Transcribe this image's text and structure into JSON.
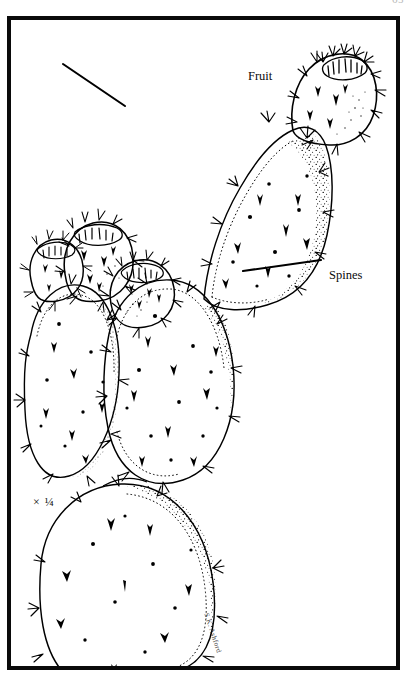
{
  "plate": {
    "page_number": "65",
    "scale_note": "× ¼",
    "artist_signature": "S.K. Ashford",
    "subject": "prickly-pear-cactus-opuntia-botanical-line-illustration"
  },
  "labels": {
    "fruit": "Fruit",
    "spines": "Spines"
  },
  "icons": {
    "fruit_leader": "leader-line-icon",
    "spines_leader": "leader-line-icon"
  },
  "illustration": {
    "style": "black-ink-line-drawing-with-stipple-shading",
    "ink_color": "#000000",
    "paper_color": "#ffffff",
    "frame_color": "#0a0a0a",
    "pads": [
      {
        "name": "upper-right-pad",
        "description": "large ovate cladode angled up to the right bearing fruit at its apex"
      },
      {
        "name": "upper-left-pad",
        "description": "ovate cladode on the left bearing two fruits at its apex"
      },
      {
        "name": "center-pad",
        "description": "large central cladode bearing one fruit at its upper left"
      },
      {
        "name": "basal-pad",
        "description": "lowest cladode, cropped by the lower frame edge"
      }
    ],
    "fruits": [
      {
        "name": "fruit-apex-right",
        "position": "top-right"
      },
      {
        "name": "fruit-left-outer",
        "position": "upper-left"
      },
      {
        "name": "fruit-left-inner",
        "position": "upper-left"
      },
      {
        "name": "fruit-center",
        "position": "mid-left"
      }
    ]
  }
}
